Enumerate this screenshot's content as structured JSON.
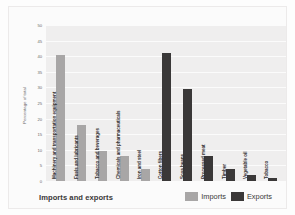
{
  "chart_data": {
    "type": "bar",
    "title": "",
    "xlabel": "Imports and exports",
    "ylabel": "Percentage of total",
    "ylim": [
      0,
      50
    ],
    "ytick_step": 5,
    "yticks": [
      "50",
      "45",
      "40",
      "35",
      "30",
      "25",
      "20",
      "15",
      "10",
      "5",
      "0"
    ],
    "grid": true,
    "legend_position": "bottom-right",
    "legend": [
      {
        "name": "Imports",
        "color": "#a8a6a6"
      },
      {
        "name": "Exports",
        "color": "#3a3838"
      }
    ],
    "categories": [
      "Machinery and transportation equipment",
      "Fuels and lubricants",
      "Tobacco and beverages",
      "Chemicals and pharmaceuticals",
      "Iron and steel",
      "Cotton fibers",
      "Soya beans",
      "Processed meat",
      "Timber",
      "Vegetable oil",
      "Tobacco"
    ],
    "bars": [
      {
        "category": "Machinery and transportation equipment",
        "series": "Imports",
        "value": 40.3
      },
      {
        "category": "Fuels and lubricants",
        "series": "Imports",
        "value": 18.0
      },
      {
        "category": "Tobacco and beverages",
        "series": "Imports",
        "value": 9.5
      },
      {
        "category": "Chemicals and pharmaceuticals",
        "series": "Imports",
        "value": 8.0
      },
      {
        "category": "Iron and steel",
        "series": "Imports",
        "value": 4.0
      },
      {
        "category": "Cotton fibers",
        "series": "Exports",
        "value": 41.0
      },
      {
        "category": "Soya beans",
        "series": "Exports",
        "value": 29.5
      },
      {
        "category": "Processed meat",
        "series": "Exports",
        "value": 8.0
      },
      {
        "category": "Timber",
        "series": "Exports",
        "value": 4.0
      },
      {
        "category": "Vegetable oil",
        "series": "Exports",
        "value": 1.8
      },
      {
        "category": "Tobacco",
        "series": "Exports",
        "value": 1.0
      }
    ]
  }
}
